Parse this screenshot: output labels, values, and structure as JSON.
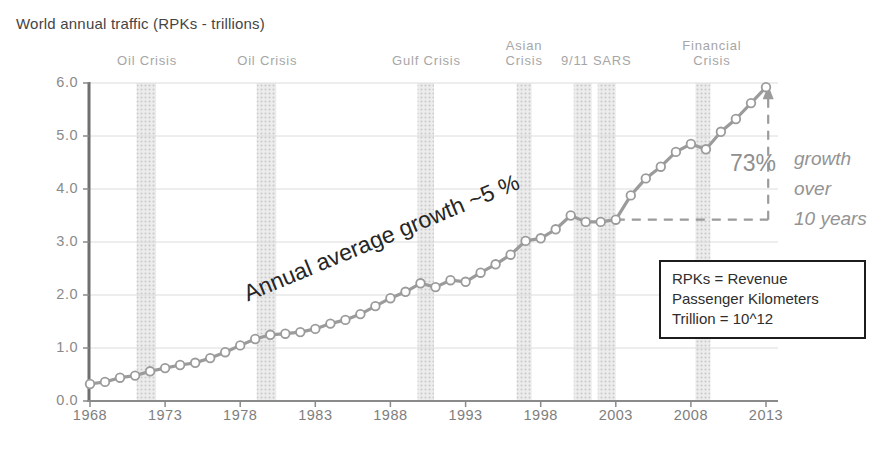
{
  "title": "World annual traffic (RPKs - trillions)",
  "chart_data": {
    "type": "line",
    "title": "World annual traffic (RPKs - trillions)",
    "xlabel": "",
    "ylabel": "",
    "years": [
      1968,
      1969,
      1970,
      1971,
      1972,
      1973,
      1974,
      1975,
      1976,
      1977,
      1978,
      1979,
      1980,
      1981,
      1982,
      1983,
      1984,
      1985,
      1986,
      1987,
      1988,
      1989,
      1990,
      1991,
      1992,
      1993,
      1994,
      1995,
      1996,
      1997,
      1998,
      1999,
      2000,
      2001,
      2002,
      2003,
      2004,
      2005,
      2006,
      2007,
      2008,
      2009,
      2010,
      2011,
      2012,
      2013
    ],
    "values": [
      0.32,
      0.36,
      0.44,
      0.48,
      0.56,
      0.62,
      0.68,
      0.72,
      0.81,
      0.92,
      1.05,
      1.17,
      1.25,
      1.27,
      1.3,
      1.36,
      1.46,
      1.53,
      1.64,
      1.79,
      1.94,
      2.06,
      2.22,
      2.15,
      2.28,
      2.25,
      2.42,
      2.58,
      2.76,
      3.02,
      3.07,
      3.24,
      3.5,
      3.38,
      3.38,
      3.42,
      3.88,
      4.2,
      4.42,
      4.7,
      4.85,
      4.75,
      5.08,
      5.32,
      5.62,
      5.92
    ],
    "x_ticks": [
      1968,
      1973,
      1978,
      1983,
      1988,
      1993,
      1998,
      2003,
      2008,
      2013
    ],
    "y_ticks": [
      0,
      1,
      2,
      3,
      4,
      5,
      6
    ],
    "y_tick_labels": [
      "0.0",
      "1.0",
      "2.0",
      "3.0",
      "4.0",
      "5.0",
      "6.0"
    ],
    "ylim": [
      0,
      6
    ],
    "xlim": [
      1968,
      2013.7
    ],
    "grid": "horizontal",
    "legend_position": "none",
    "crisis_bands": [
      {
        "label": "Oil Crisis",
        "from": 1971.1,
        "to": 1972.4
      },
      {
        "label": "Oil Crisis",
        "from": 1979.1,
        "to": 1980.4
      },
      {
        "label": "Gulf Crisis",
        "from": 1989.8,
        "to": 1990.9
      },
      {
        "label": "Asian Crisis",
        "from": 1996.4,
        "to": 1997.4
      },
      {
        "label": "9/11",
        "from": 2000.2,
        "to": 2001.4
      },
      {
        "label": "SARS",
        "from": 2001.8,
        "to": 2003.0
      },
      {
        "label": "Financial Crisis",
        "from": 2008.3,
        "to": 2009.3
      }
    ],
    "crisis_labels": [
      {
        "text": "Oil Crisis",
        "center_year": 1971.8
      },
      {
        "text": "Oil Crisis",
        "center_year": 1979.8
      },
      {
        "text": "Gulf Crisis",
        "center_year": 1990.4
      },
      {
        "text": "Asian\nCrisis",
        "center_year": 1996.9
      },
      {
        "text": "9/11 SARS",
        "center_year": 2001.7
      },
      {
        "text": "Financial\nCrisis",
        "center_year": 2009.4
      }
    ]
  },
  "annotations": {
    "avg_growth": "Annual average growth ~5 %",
    "pct": "73%",
    "pct_note": [
      "growth",
      "over",
      "10 years"
    ],
    "dashed_guide": {
      "from_year": 2003,
      "level": 3.42,
      "corner_year": 2013.15,
      "top_value": 5.75
    }
  },
  "legend_box": {
    "lines": [
      "RPKs = Revenue",
      "Passenger Kilometers",
      "Trillion = 10^12"
    ]
  },
  "colors": {
    "line": "#9b9b9b",
    "band_bg": "#ececec",
    "band_dot": "#c9c9c9",
    "grid": "#dcdcdc",
    "axis_y": "#6f6f6f",
    "axis_x": "#8a8a8a",
    "tick_label": "#7e7e7e",
    "crisis_label": "#a6a6a6",
    "title": "#454545",
    "annotation_dark": "#262626",
    "annotation_gray": "#8f8f8f",
    "legend_border": "#1c1c1c"
  }
}
